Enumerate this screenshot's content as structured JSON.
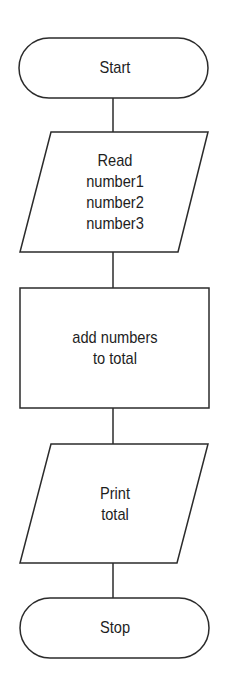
{
  "flowchart": {
    "nodes": [
      {
        "id": "start",
        "type": "terminal",
        "label": "Start"
      },
      {
        "id": "input",
        "type": "input-output",
        "label": "Read\nnumber1\nnumber2\nnumber3"
      },
      {
        "id": "process",
        "type": "process",
        "label": "add numbers\nto total"
      },
      {
        "id": "output",
        "type": "input-output",
        "label": "Print\ntotal"
      },
      {
        "id": "stop",
        "type": "terminal",
        "label": "Stop"
      }
    ],
    "edges": [
      {
        "from": "start",
        "to": "input"
      },
      {
        "from": "input",
        "to": "process"
      },
      {
        "from": "process",
        "to": "output"
      },
      {
        "from": "output",
        "to": "stop"
      }
    ]
  }
}
